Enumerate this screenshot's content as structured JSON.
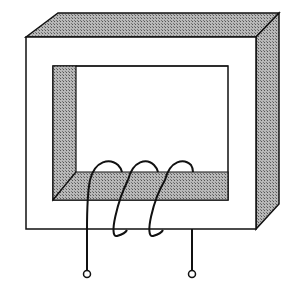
{
  "diagram": {
    "colors": {
      "background": "#ffffff",
      "line": "#111111",
      "shade": "#9a9a9a"
    },
    "core": {
      "front_outer": [
        26,
        37,
        256,
        229
      ],
      "window": [
        53,
        66,
        228,
        200
      ]
    },
    "coil": {
      "turns": 3,
      "terminals": [
        {
          "x": 87,
          "y": 274
        },
        {
          "x": 192,
          "y": 274
        }
      ]
    }
  }
}
